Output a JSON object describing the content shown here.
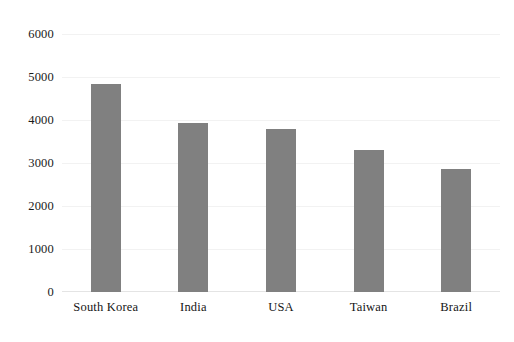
{
  "chart_data": {
    "type": "bar",
    "title": "",
    "subtitle": "",
    "xlabel": "",
    "ylabel": "",
    "categories": [
      "South Korea",
      "India",
      "USA",
      "Taiwan",
      "Brazil"
    ],
    "values": [
      4830,
      3920,
      3800,
      3300,
      2870
    ],
    "ylim": [
      0,
      6000
    ],
    "yticks": [
      0,
      1000,
      2000,
      3000,
      4000,
      5000,
      6000
    ],
    "ytick_labels": [
      "0",
      "1000",
      "2000",
      "3000",
      "4000",
      "5000",
      "6000"
    ],
    "grid": true,
    "legend": "none",
    "series": [
      {
        "name": "",
        "values": [
          4830,
          3920,
          3800,
          3300,
          2870
        ]
      }
    ],
    "colors": {
      "bar": "#808080",
      "gridline": "#f2f2f2",
      "axis": "#e4e4e4",
      "text": "#1a1a1a",
      "background": "#ffffff"
    }
  }
}
